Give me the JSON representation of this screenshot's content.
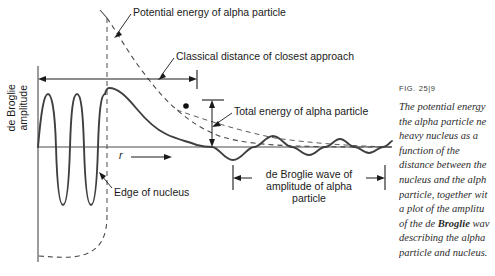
{
  "figure": {
    "title_labels": {
      "potential_energy": "Potential energy of alpha particle",
      "classical_distance": "Classical distance of closest approach",
      "total_energy": "Total energy of alpha particle",
      "edge_of_nucleus": "Edge of nucleus",
      "de_broglie_wave": "de Broglie wave of amplitude of alpha particle",
      "y_axis": "de Broglie amplitude",
      "x_axis": "r"
    },
    "caption": {
      "fig_number": "FIG. 25|9",
      "lines": [
        "The potential energy",
        "the alpha particle ne",
        "heavy nucleus as a",
        "function of the",
        "distance between the",
        "nucleus and the alph",
        "particle, together wit",
        "a plot of the amplitu",
        "of the de Broglie wav",
        "describing the alpha",
        "particle and nucleus."
      ]
    },
    "colors": {
      "ink": "#1a1a1a",
      "curve": "#3f3f3f",
      "axis": "#4a4a4a",
      "dashed": "#4a4a4a",
      "background": "#ffffff"
    }
  },
  "chart_data": {
    "type": "line",
    "xlabel": "r",
    "ylabel": "de Broglie amplitude",
    "grid": false,
    "legend": "none",
    "annotations": [
      {
        "name": "potential-energy-curve",
        "style": "dashed",
        "text": "Potential energy of alpha particle"
      },
      {
        "name": "classical-distance-arrow",
        "style": "double-arrow",
        "text": "Classical distance of closest approach",
        "x_from": 38,
        "x_to": 197
      },
      {
        "name": "total-energy-arrow",
        "style": "double-arrow",
        "text": "Total energy of alpha particle"
      },
      {
        "name": "edge-of-nucleus-line",
        "style": "dashed-vertical",
        "text": "Edge of nucleus",
        "x": 107
      },
      {
        "name": "de-broglie-span-arrow",
        "style": "double-arrow",
        "text": "de Broglie wave of amplitude of alpha particle",
        "x_from": 233,
        "x_to": 385
      },
      {
        "name": "closest-approach-dot",
        "style": "point-marker",
        "x": 186,
        "y": 106
      }
    ],
    "series": [
      {
        "name": "Potential energy (Coulomb barrier + well)",
        "style": "dashed",
        "description": "1/r Coulomb repulsion outside nucleus, deep square well inside"
      },
      {
        "name": "de Broglie amplitude",
        "style": "solid",
        "description": "High frequency standing wave inside nucleus, decaying envelope through barrier, small travelling wave outside"
      },
      {
        "name": "Total energy of alpha particle",
        "style": "dashed-horizontal-asymptote",
        "description": "Constant energy level intersecting potential curve at classical distance of closest approach"
      }
    ],
    "axes": {
      "baseline_y": 147,
      "y_axis_x": 38,
      "nucleus_edge_x": 107,
      "plot_right_x": 392
    }
  }
}
